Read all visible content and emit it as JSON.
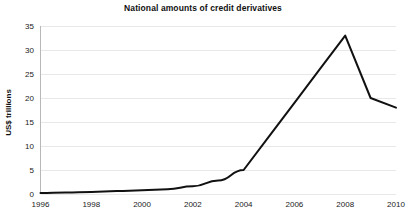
{
  "chart_data": {
    "type": "line",
    "title": "National amounts of credit derivatives",
    "xlabel": "",
    "ylabel": "US$ trillions",
    "x": [
      1996,
      1997,
      1998,
      1999,
      2000,
      2001,
      2002,
      2003,
      2004,
      2005,
      2006,
      2007,
      2008,
      2009,
      2010
    ],
    "values": [
      0.2,
      0.3,
      0.4,
      0.6,
      0.8,
      1.0,
      1.6,
      2.8,
      5.0,
      12.0,
      19.0,
      26.0,
      33.0,
      20.0,
      18.0
    ],
    "series": [
      {
        "name": "Notional amount",
        "values": [
          0.2,
          0.3,
          0.4,
          0.6,
          0.8,
          1.0,
          1.6,
          2.8,
          5.0,
          12.0,
          19.0,
          26.0,
          33.0,
          20.0,
          18.0
        ]
      }
    ],
    "xlim": [
      1996,
      2010
    ],
    "ylim": [
      0,
      35
    ],
    "yticks": [
      0,
      5,
      10,
      15,
      20,
      25,
      30,
      35
    ],
    "ytick_labels": [
      "0",
      "5",
      "10",
      "15",
      "20",
      "25",
      "30",
      "35"
    ],
    "xticks": [
      1996,
      1998,
      2000,
      2002,
      2004,
      2006,
      2008,
      2010
    ],
    "xtick_labels": [
      "1996",
      "1998",
      "2000",
      "2002",
      "2004",
      "2006",
      "2008",
      "2010"
    ],
    "grid": "horizontal",
    "legend": "none",
    "line_color": "#111111",
    "grid_color": "#e8e8e8",
    "background_color": "#ffffff"
  }
}
